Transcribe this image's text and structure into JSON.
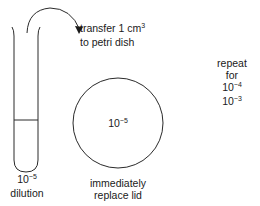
{
  "instruction": {
    "line1_prefix": "transfer 1 cm",
    "line1_sup": "3",
    "line2": "to petri dish"
  },
  "test_tube": {
    "caption_base": "10",
    "caption_exp": "−5",
    "caption_label": "dilution"
  },
  "petri_dish": {
    "value_base": "10",
    "value_exp": "−5",
    "caption_line1": "immediately",
    "caption_line2": "replace lid"
  },
  "repeat_note": {
    "line1": "repeat",
    "line2": "for",
    "items": [
      {
        "base": "10",
        "exp": "−4"
      },
      {
        "base": "10",
        "exp": "−3"
      }
    ]
  },
  "colors": {
    "stroke": "#2a2a2a",
    "background": "#ffffff"
  }
}
